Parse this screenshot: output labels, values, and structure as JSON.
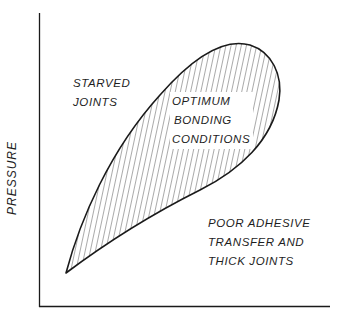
{
  "figure": {
    "type": "region-diagram",
    "y_axis_label": "PRESSURE",
    "x_axis_label": "",
    "regions": [
      {
        "name": "starved-joints",
        "lines": [
          "STARVED",
          "JOINTS"
        ]
      },
      {
        "name": "optimum-bonding-conditions",
        "lines": [
          "OPTIMUM",
          "BONDING",
          "CONDITIONS"
        ],
        "fill": "vertical-hatch"
      },
      {
        "name": "poor-adhesive-transfer",
        "lines": [
          "POOR ADHESIVE",
          "TRANSFER AND",
          "THICK JOINTS"
        ]
      }
    ],
    "colors": {
      "line": "#1a1a1a",
      "background": "#ffffff"
    }
  }
}
